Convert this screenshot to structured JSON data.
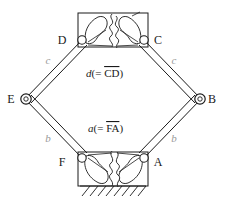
{
  "figure": {
    "type": "mechanism-diagram",
    "background_color": "#ffffff",
    "line_color": "#1a1a1a",
    "dim_label_color": "#9a9a9a"
  },
  "vertices": [
    {
      "id": "D",
      "label": "D",
      "x": 82,
      "y": 40,
      "label_x": 62,
      "label_y": 44,
      "joint": "pin"
    },
    {
      "id": "C",
      "label": "C",
      "x": 144,
      "y": 40,
      "label_x": 156,
      "label_y": 44,
      "joint": "pin"
    },
    {
      "id": "E",
      "label": "E",
      "x": 25,
      "y": 99,
      "label_x": 10,
      "label_y": 103,
      "joint": "pin"
    },
    {
      "id": "B",
      "label": "B",
      "x": 201,
      "y": 99,
      "label_x": 207,
      "label_y": 103,
      "joint": "pin"
    },
    {
      "id": "F",
      "label": "F",
      "x": 82,
      "y": 158,
      "label_x": 62,
      "label_y": 166,
      "joint": "pin"
    },
    {
      "id": "A",
      "label": "A",
      "x": 144,
      "y": 158,
      "label_x": 156,
      "label_y": 166,
      "joint": "pin"
    }
  ],
  "link_labels": [
    {
      "id": "c-left",
      "text": "c",
      "x": 48,
      "y": 62,
      "color": "#9a9a9a"
    },
    {
      "id": "c-right",
      "text": "c",
      "x": 172,
      "y": 62,
      "color": "#9a9a9a"
    },
    {
      "id": "b-left",
      "text": "b",
      "x": 48,
      "y": 140,
      "color": "#9a9a9a"
    },
    {
      "id": "b-right",
      "text": "b",
      "x": 172,
      "y": 140,
      "color": "#9a9a9a"
    }
  ],
  "equation_labels": [
    {
      "id": "d-equals-CD",
      "italic_symbol": "d",
      "open": "(= ",
      "overline_text": "CD",
      "close": ")",
      "x": 88,
      "y": 76
    },
    {
      "id": "a-equals-FA",
      "italic_symbol": "a",
      "open": "(= ",
      "overline_text": "FA",
      "close": ")",
      "x": 90,
      "y": 131
    }
  ],
  "blocks": [
    {
      "id": "top-flexure-block",
      "x": 78,
      "y": 13,
      "width": 70,
      "height": 34
    },
    {
      "id": "bottom-flexure-block",
      "x": 78,
      "y": 152,
      "width": 70,
      "height": 34
    }
  ],
  "ground": {
    "id": "ground-hatching",
    "x": 80,
    "y": 186,
    "width": 66,
    "hatch_count": 9,
    "hatch_angle_deg": 45
  }
}
